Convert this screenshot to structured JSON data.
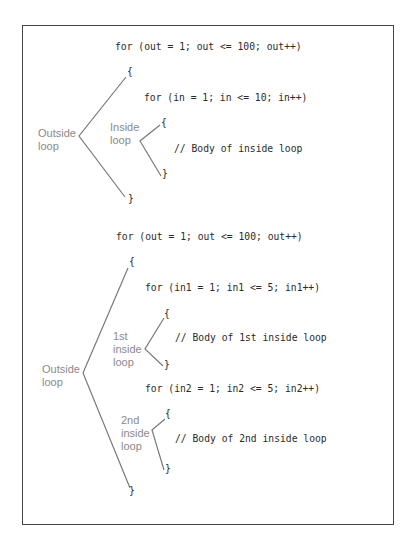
{
  "diagram_1": {
    "outer_for": "for (out = 1; out <= 100; out++)",
    "outer_open": "{",
    "inner_for": "for (in = 1; in <= 10; in++)",
    "inner_open": "{",
    "inner_body": "// Body of inside loop",
    "inner_close": "}",
    "outer_close": "}",
    "outer_label_1": "Outside",
    "outer_label_2": "loop",
    "inner_label_1": "Inside",
    "inner_label_2": "loop"
  },
  "diagram_2": {
    "outer_for": "for (out = 1; out <= 100; out++)",
    "outer_open": "{",
    "inner1_for": "for (in1 = 1; in1 <= 5; in1++)",
    "inner1_open": "{",
    "inner1_body": "// Body of 1st inside loop",
    "inner1_close": "}",
    "inner2_for": "for (in2 = 1; in2 <= 5; in2++)",
    "inner2_open": "{",
    "inner2_body": "// Body of 2nd inside loop",
    "inner2_close": "}",
    "outer_close": "}",
    "outer_label_1": "Outside",
    "outer_label_2": "loop",
    "inner1_label_1": "1st",
    "inner1_label_2": "inside",
    "inner1_label_3": "loop",
    "inner2_label_1": "2nd",
    "inner2_label_2": "inside",
    "inner2_label_3": "loop"
  },
  "colors": {
    "code_text": "#2a2a2a",
    "label_text": "#8a8a8a",
    "bracket_line": "#7a7a7a",
    "frame_border": "#444444"
  }
}
